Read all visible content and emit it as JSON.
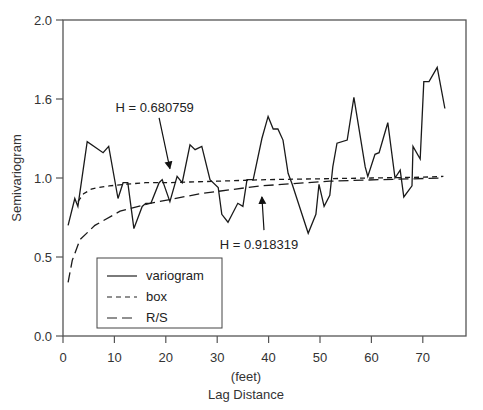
{
  "chart_data": {
    "type": "line",
    "title": "",
    "xlabel": "Lag Distance",
    "xlabel_unit": "(feet)",
    "ylabel": "Semivariogram",
    "xlim": [
      0,
      78
    ],
    "ylim": [
      0.0,
      2.0
    ],
    "x_ticks": [
      0,
      10,
      20,
      30,
      40,
      50,
      60,
      70
    ],
    "y_ticks": [
      {
        "pos": 0.0,
        "label": "0.0"
      },
      {
        "pos": 0.5,
        "label": "0.5"
      },
      {
        "pos": 1.0,
        "label": "1.0"
      },
      {
        "pos": 1.5,
        "label": "1.6"
      },
      {
        "pos": 2.0,
        "label": "2.0"
      }
    ],
    "grid": false,
    "legend_position": "lower left",
    "series": [
      {
        "name": "variogram",
        "style": "solid",
        "x": [
          1.0,
          2.3,
          2.9,
          4.7,
          7.8,
          8.9,
          10.7,
          11.7,
          12.6,
          13.8,
          15.4,
          16.1,
          17.1,
          18.7,
          19.3,
          20.8,
          22.2,
          23.2,
          24.7,
          25.7,
          27.0,
          28.6,
          30.2,
          30.9,
          32.1,
          34.0,
          35.0,
          35.8,
          37.0,
          38.7,
          39.9,
          40.9,
          41.8,
          42.8,
          43.8,
          44.6,
          47.7,
          49.2,
          49.8,
          50.8,
          51.9,
          52.5,
          53.3,
          55.3,
          56.6,
          58.8,
          59.3,
          60.7,
          61.5,
          62.3,
          63.2,
          64.6,
          65.6,
          66.3,
          67.9,
          68.1,
          69.5,
          70.2,
          71.2,
          72.8,
          74.3
        ],
        "y": [
          0.7,
          0.87,
          0.82,
          1.23,
          1.16,
          1.2,
          0.87,
          0.97,
          0.97,
          0.68,
          0.82,
          0.84,
          0.84,
          0.97,
          0.99,
          0.85,
          1.01,
          0.97,
          1.21,
          1.18,
          1.2,
          0.99,
          0.94,
          0.77,
          0.72,
          0.84,
          0.82,
          0.99,
          0.99,
          1.25,
          1.39,
          1.31,
          1.31,
          1.24,
          1.03,
          0.96,
          0.65,
          0.77,
          0.96,
          0.82,
          0.89,
          1.07,
          1.22,
          1.24,
          1.51,
          1.07,
          1.01,
          1.15,
          1.16,
          1.25,
          1.35,
          1.0,
          1.05,
          0.88,
          0.95,
          1.2,
          1.12,
          1.61,
          1.61,
          1.7,
          1.44
        ]
      },
      {
        "name": "box",
        "style": "short-dash",
        "x": [
          2.9,
          4.0,
          5.5,
          7.0,
          9.0,
          12.0,
          16.0,
          20.0,
          30.0,
          40.0,
          50.0,
          60.0,
          70.0,
          74.0
        ],
        "y": [
          0.85,
          0.9,
          0.93,
          0.94,
          0.95,
          0.96,
          0.97,
          0.97,
          0.98,
          0.99,
          0.995,
          1.0,
          1.005,
          1.01
        ]
      },
      {
        "name": "R/S",
        "style": "long-dash",
        "x": [
          1.0,
          1.8,
          3.3,
          6.2,
          11.1,
          16.9,
          26.6,
          38.3,
          51.9,
          62.0,
          74.0
        ],
        "y": [
          0.34,
          0.48,
          0.61,
          0.7,
          0.79,
          0.84,
          0.9,
          0.95,
          0.98,
          0.99,
          1.0
        ]
      }
    ],
    "annotations": [
      {
        "text": "H = 0.680759",
        "text_x": 10.2,
        "text_y": 1.42,
        "arrow_from": [
          18.7,
          1.38
        ],
        "arrow_to": [
          20.8,
          1.06
        ]
      },
      {
        "text": "H = 0.918319",
        "text_x": 30.5,
        "text_y": 0.55,
        "arrow_from": [
          39.1,
          0.67
        ],
        "arrow_to": [
          38.7,
          0.88
        ]
      }
    ]
  },
  "legend": {
    "items": [
      {
        "label": "variogram",
        "style": "solid"
      },
      {
        "label": "box",
        "style": "short-dash"
      },
      {
        "label": "R/S",
        "style": "long-dash"
      }
    ]
  }
}
